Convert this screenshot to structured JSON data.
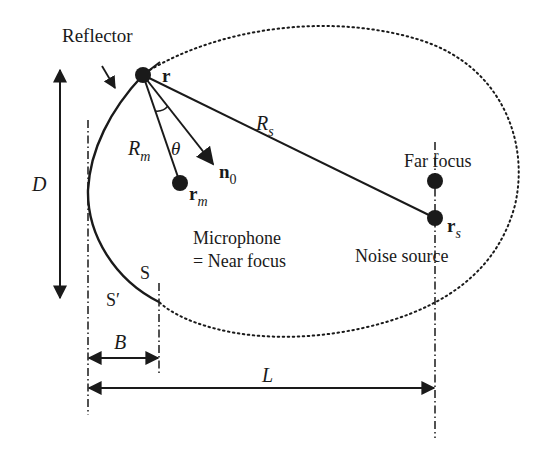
{
  "diagram": {
    "colors": {
      "ink": "#1a1a1a",
      "background": "#ffffff"
    },
    "labels": {
      "reflector": "Reflector",
      "point_r": "r",
      "R_m_main": "R",
      "R_m_sub": "m",
      "theta": "θ",
      "n0_main": "n",
      "n0_sub": "0",
      "rm_main": "r",
      "rm_sub": "m",
      "R_s_main": "R",
      "R_s_sub": "s",
      "far_focus": "Far focus",
      "rs_main": "r",
      "rs_sub": "s",
      "microphone": "Microphone",
      "near_focus": "= Near focus",
      "noise_source": "Noise source",
      "S": "S",
      "S_prime": "S′",
      "D": "D",
      "B": "B",
      "L": "L"
    },
    "points": [
      {
        "name": "r",
        "x": 143,
        "y": 75
      },
      {
        "name": "r_m",
        "x": 180,
        "y": 183
      },
      {
        "name": "far_focus",
        "x": 435,
        "y": 181
      },
      {
        "name": "r_s",
        "x": 435,
        "y": 218
      }
    ],
    "dimensions": [
      {
        "name": "D",
        "orientation": "vertical"
      },
      {
        "name": "B",
        "orientation": "horizontal"
      },
      {
        "name": "L",
        "orientation": "horizontal"
      }
    ]
  }
}
